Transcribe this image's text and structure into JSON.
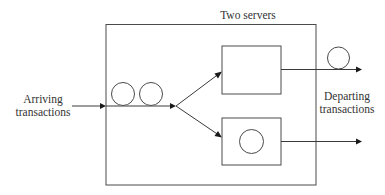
{
  "diagram": {
    "title": "Two servers",
    "arriving_label_line1": "Arriving",
    "arriving_label_line2": "transactions",
    "departing_label_line1": "Departing",
    "departing_label_line2": "transactions",
    "colors": {
      "line": "#3a3a3a",
      "arrowhead": "#1a1a1a",
      "text": "#333333",
      "background": "#ffffff"
    },
    "nodes": [
      {
        "id": "system-boundary",
        "type": "rect",
        "label": "Two servers"
      },
      {
        "id": "queue",
        "type": "queue",
        "waiting_items": 2
      },
      {
        "id": "server-1",
        "type": "rect",
        "busy": false
      },
      {
        "id": "server-2",
        "type": "rect",
        "busy": true,
        "items": 1
      },
      {
        "id": "departed-item",
        "type": "circle"
      }
    ],
    "edges": [
      {
        "from": "arrivals",
        "to": "queue",
        "label": "Arriving transactions"
      },
      {
        "from": "queue",
        "to": "server-1"
      },
      {
        "from": "queue",
        "to": "server-2"
      },
      {
        "from": "server-1",
        "to": "departures",
        "label": "Departing transactions"
      },
      {
        "from": "server-2",
        "to": "departures"
      }
    ]
  }
}
